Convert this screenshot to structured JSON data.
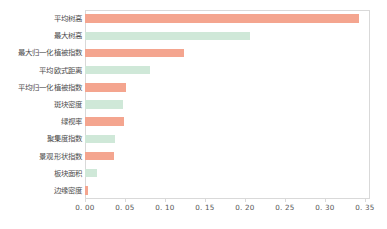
{
  "chart_data": {
    "type": "bar",
    "orientation": "horizontal",
    "title": "",
    "subtitle": "",
    "xlabel": "",
    "ylabel": "",
    "xlim": [
      0.0,
      0.35
    ],
    "ylim": null,
    "grid": false,
    "legend": null,
    "categories": [
      "平均树高",
      "最大树高",
      "最大归一化植被指数",
      "平均欧式距离",
      "平均归一化植被指数",
      "斑块密度",
      "绿视率",
      "聚集度指数",
      "景观形状指数",
      "板块面积",
      "边缘密度"
    ],
    "values": [
      0.342,
      0.206,
      0.124,
      0.081,
      0.051,
      0.048,
      0.049,
      0.038,
      0.036,
      0.015,
      0.004
    ],
    "bar_colors": [
      "#F4A58F",
      "#CFE8D8",
      "#F4A58F",
      "#CFE8D8",
      "#F4A58F",
      "#CFE8D8",
      "#F4A58F",
      "#CFE8D8",
      "#F4A58F",
      "#CFE8D8",
      "#F4A58F"
    ],
    "xticks": [
      0.0,
      0.05,
      0.1,
      0.15,
      0.2,
      0.25,
      0.3,
      0.35
    ],
    "xtick_labels": [
      "0. 00",
      "0. 05",
      "0. 10",
      "0. 15",
      "0. 20",
      "0. 25",
      "0. 30",
      "0. 35"
    ],
    "colors": {
      "salmon": "#F4A58F",
      "mint": "#CFE8D8",
      "frame": "#d9d9d9",
      "text": "#555555",
      "background": "#ffffff"
    }
  }
}
